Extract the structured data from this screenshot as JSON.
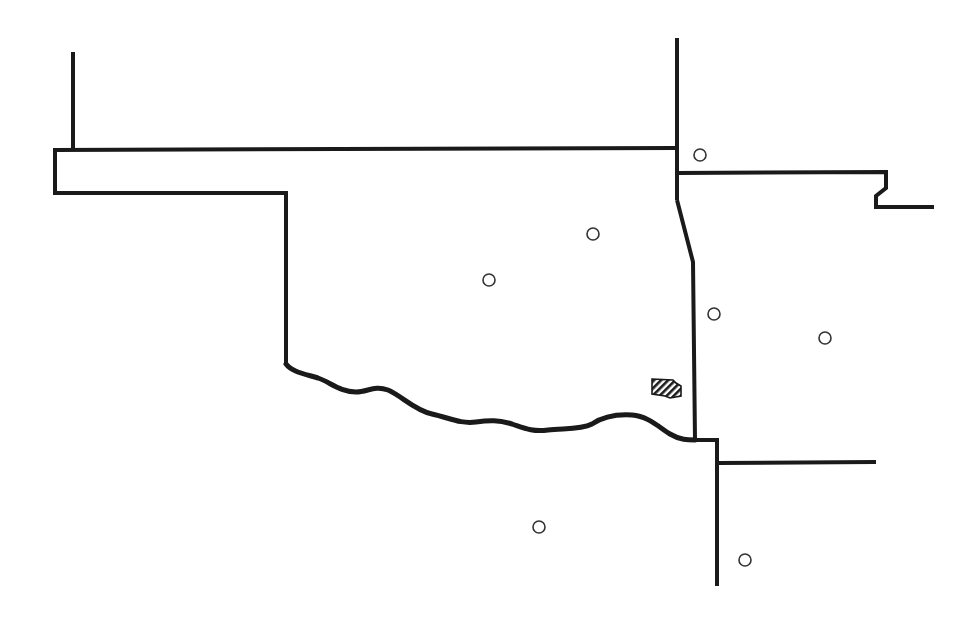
{
  "map": {
    "subject": "Oklahoma and neighboring state borders",
    "colors": {
      "background": "#ffffff",
      "border": "#1a1a1a",
      "site_marker": "#333333",
      "hatched_area": "#1a1a1a"
    },
    "site_markers": [
      {
        "id": "site-1",
        "x": 700,
        "y": 155
      },
      {
        "id": "site-2",
        "x": 593,
        "y": 234
      },
      {
        "id": "site-3",
        "x": 489,
        "y": 280
      },
      {
        "id": "site-4",
        "x": 714,
        "y": 314
      },
      {
        "id": "site-5",
        "x": 825,
        "y": 338
      },
      {
        "id": "site-6",
        "x": 539,
        "y": 527
      },
      {
        "id": "site-7",
        "x": 745,
        "y": 560
      }
    ],
    "hatched_area": {
      "id": "hatched-region",
      "x": 651,
      "y": 379,
      "width": 31,
      "height": 20
    }
  }
}
